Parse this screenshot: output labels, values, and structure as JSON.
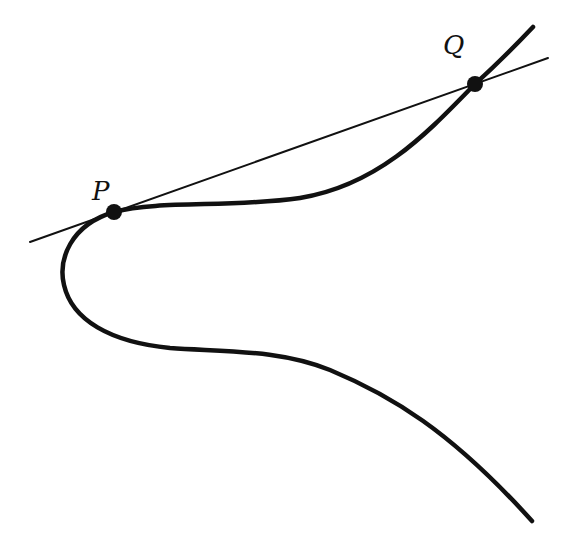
{
  "diagram": {
    "colors": {
      "curve": "#111111",
      "line": "#111111",
      "point": "#111111",
      "background": "#ffffff"
    },
    "labels": {
      "p": "P",
      "q": "Q"
    },
    "points": [
      {
        "name": "P",
        "x": 114,
        "y": 212
      },
      {
        "name": "Q",
        "x": 475,
        "y": 84
      }
    ],
    "secant_line": {
      "x1": 30,
      "y1": 242,
      "x2": 548,
      "y2": 58
    }
  }
}
